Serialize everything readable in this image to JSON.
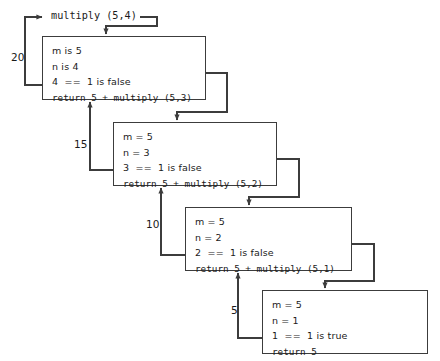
{
  "diagram": {
    "title_call": "multiply (5,4)",
    "frames": [
      {
        "id": "frame-1",
        "lines": [
          "m is 5",
          "n is 4",
          "4  ==  1 is false"
        ],
        "return_line": "return 5 + multiply (5,3)",
        "return_value": "20",
        "x": 42,
        "y": 36,
        "w": 164,
        "h": 64
      },
      {
        "id": "frame-2",
        "lines": [
          "m = 5",
          "n = 3",
          "3  ==  1 is false"
        ],
        "return_line": "return 5 + multiply (5,2)",
        "return_value": "15",
        "x": 113,
        "y": 122,
        "w": 164,
        "h": 64
      },
      {
        "id": "frame-3",
        "lines": [
          "m = 5",
          "n = 2",
          "2  ==  1 is false"
        ],
        "return_line": "return 5 + multiply (5,1)",
        "return_value": "10",
        "x": 185,
        "y": 207,
        "w": 167,
        "h": 64
      },
      {
        "id": "frame-4",
        "lines": [
          "m = 5",
          "n = 1",
          "1  ==  1 is true"
        ],
        "return_line": "return 5",
        "return_value": "5",
        "x": 262,
        "y": 290,
        "w": 166,
        "h": 64
      }
    ],
    "colors": {
      "stroke": "#3c3c3c",
      "text": "#1a1a1a",
      "background": "#ffffff"
    }
  }
}
